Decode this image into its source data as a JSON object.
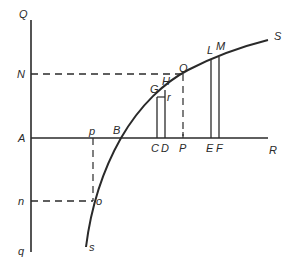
{
  "diagram": {
    "type": "geometric-construction",
    "colors": {
      "stroke": "#2a2a2a",
      "background": "#ffffff"
    },
    "labels": {
      "Q": "Q",
      "N": "N",
      "A": "A",
      "n": "n",
      "q": "q",
      "p_upper": "p",
      "B": "B",
      "C": "C",
      "D": "D",
      "P": "P",
      "E": "E",
      "F": "F",
      "R": "R",
      "G": "G",
      "H": "H",
      "r": "r",
      "O": "O",
      "L": "L",
      "M": "M",
      "S": "S",
      "o": "o",
      "s": "s"
    }
  }
}
